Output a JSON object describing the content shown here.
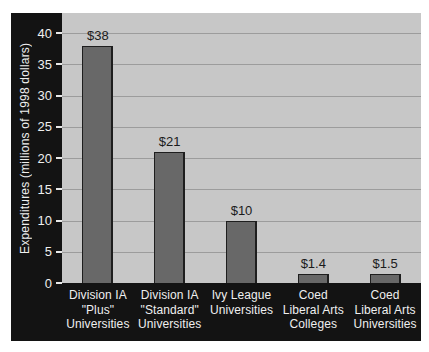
{
  "chart_data": {
    "type": "bar",
    "title": "",
    "xlabel": "",
    "ylabel": "Expenditures (millions of 1998 dollars)",
    "categories": [
      "Division IA \"Plus\" Universities",
      "Division IA \"Standard\" Universities",
      "Ivy League Universities",
      "Coed Liberal Arts Colleges",
      "Coed Liberal Arts Universities"
    ],
    "category_lines": [
      [
        "Division IA",
        "\"Plus\"",
        "Universities"
      ],
      [
        "Division IA",
        "\"Standard\"",
        "Universities"
      ],
      [
        "Ivy League",
        "Universities"
      ],
      [
        "Coed",
        "Liberal Arts",
        "Colleges"
      ],
      [
        "Coed",
        "Liberal Arts",
        "Universities"
      ]
    ],
    "values": [
      38,
      21,
      10,
      1.4,
      1.5
    ],
    "value_labels": [
      "$38",
      "$21",
      "$10",
      "$1.4",
      "$1.5"
    ],
    "yticks": [
      0,
      5,
      10,
      15,
      20,
      25,
      30,
      35,
      40
    ],
    "ylim": [
      0,
      43.2
    ],
    "grid": "horizontal",
    "legend": "none",
    "colors": {
      "frame": "#131313",
      "plot_bg": "#c7c7c7",
      "gridline": "#9c9c9c",
      "bar_fill": "#686868",
      "bar_border": "#1e1e1e",
      "axis_text": "#efefef",
      "tick_dash": "#e8e8e8",
      "value_text": "#1b1b1b",
      "page_bg": "#ffffff"
    }
  }
}
